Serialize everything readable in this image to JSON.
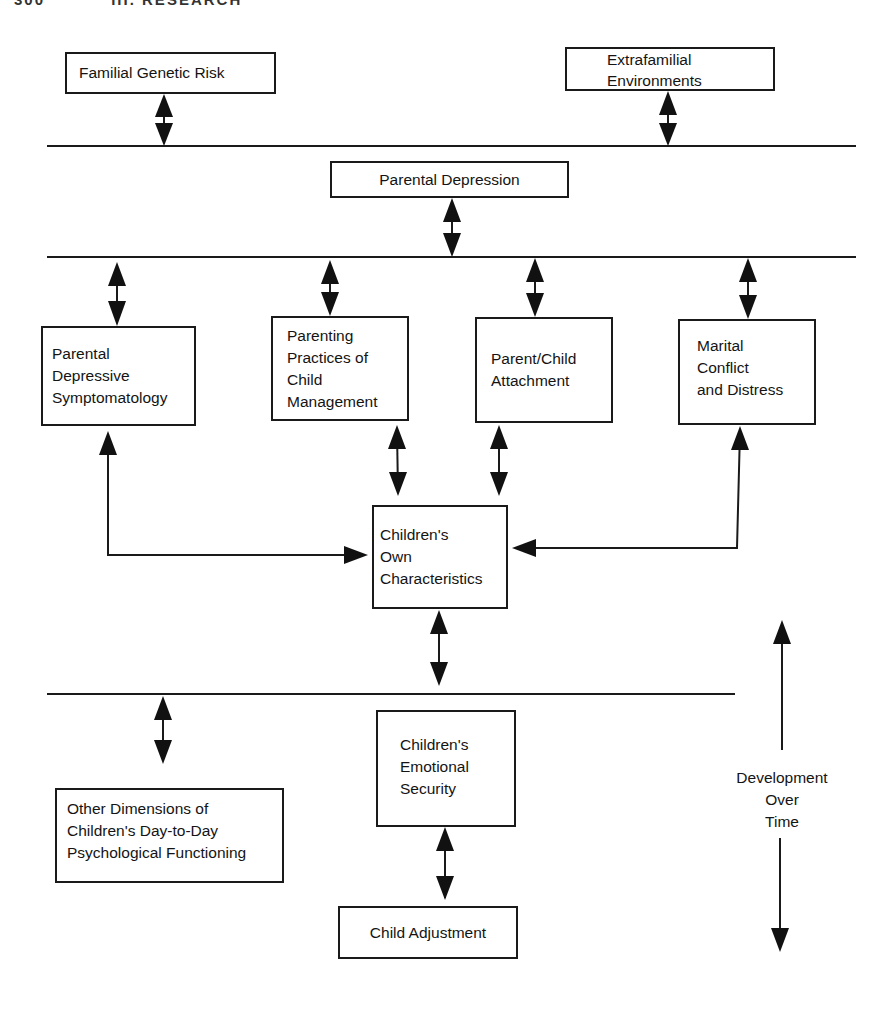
{
  "page_header": {
    "page_number": "300",
    "section": "III. RESEARCH"
  },
  "diagram": {
    "nodes": {
      "familial_genetic_risk": "Familial Genetic Risk",
      "extrafamilial_environments": "Extrafamilial\nEnvironments",
      "parental_depression": "Parental Depression",
      "parental_depressive_symptomatology": "Parental\nDepressive\nSymptomatology",
      "parenting_practices": "Parenting\nPractices of\nChild\nManagement",
      "parent_child_attachment": "Parent/Child\nAttachment",
      "marital_conflict": "Marital\nConflict\nand Distress",
      "childrens_own_characteristics": "Children's\nOwn\nCharacteristics",
      "childrens_emotional_security": "Children's\nEmotional\nSecurity",
      "other_dimensions": "Other Dimensions of\nChildren's Day-to-Day\nPsychological Functioning",
      "child_adjustment": "Child Adjustment"
    },
    "timeline_label": "Development\nOver\nTime",
    "edges": [
      {
        "from": "Familial Genetic Risk",
        "to": "Level line 1",
        "type": "bidirectional"
      },
      {
        "from": "Extrafamilial Environments",
        "to": "Level line 1",
        "type": "bidirectional"
      },
      {
        "from": "Parental Depression",
        "to": "Level line 2",
        "type": "bidirectional"
      },
      {
        "from": "Level line 2",
        "to": "Parental Depressive Symptomatology",
        "type": "bidirectional"
      },
      {
        "from": "Level line 2",
        "to": "Parenting Practices of Child Management",
        "type": "bidirectional"
      },
      {
        "from": "Level line 2",
        "to": "Parent/Child Attachment",
        "type": "bidirectional"
      },
      {
        "from": "Level line 2",
        "to": "Marital Conflict and Distress",
        "type": "bidirectional"
      },
      {
        "from": "Parenting Practices of Child Management",
        "to": "Children's Own Characteristics",
        "type": "bidirectional"
      },
      {
        "from": "Parent/Child Attachment",
        "to": "Children's Own Characteristics",
        "type": "bidirectional"
      },
      {
        "from": "Parental Depressive Symptomatology",
        "to": "Children's Own Characteristics",
        "type": "bidirectional-elbow"
      },
      {
        "from": "Marital Conflict and Distress",
        "to": "Children's Own Characteristics",
        "type": "bidirectional-elbow"
      },
      {
        "from": "Children's Own Characteristics",
        "to": "Level line 3",
        "type": "bidirectional"
      },
      {
        "from": "Level line 3",
        "to": "Other Dimensions of Children's Day-to-Day Psychological Functioning",
        "type": "bidirectional"
      },
      {
        "from": "Children's Emotional Security",
        "to": "Child Adjustment",
        "type": "bidirectional"
      }
    ]
  },
  "colors": {
    "ink": "#141414",
    "background": "#ffffff"
  }
}
